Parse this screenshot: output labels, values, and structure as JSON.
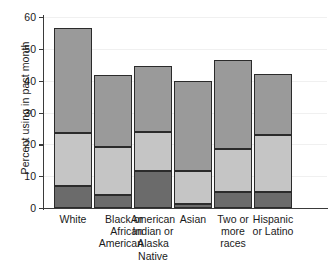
{
  "chart_data": {
    "type": "bar",
    "subtype": "stacked-bar",
    "title": "",
    "xlabel": "",
    "ylabel": "Percent using in past month",
    "ylim": [
      0,
      60
    ],
    "yticks": [
      0,
      10,
      20,
      30,
      40,
      50,
      60
    ],
    "ytick_labels": [
      "0",
      "10",
      "20",
      "30",
      "40",
      "50",
      "60"
    ],
    "grid": true,
    "grid_axis": "y",
    "legend": "none",
    "categories": [
      "White",
      "Black or\nAfrican\nAmerican",
      "American\nIndian or\nAlaska\nNative",
      "Asian",
      "Two or\nmore\nraces",
      "Hispanic\nor Latino"
    ],
    "category_align": [
      "center",
      "right",
      "center",
      "center",
      "center",
      "center"
    ],
    "series": [
      {
        "name": "bottom-segment",
        "color": "#6b6b6b",
        "values": [
          7.0,
          4.1,
          11.7,
          1.3,
          5.0,
          4.9
        ]
      },
      {
        "name": "middle-segment",
        "color": "#c5c5c5",
        "values": [
          16.6,
          15.1,
          12.3,
          10.2,
          13.6,
          17.9
        ]
      },
      {
        "name": "top-segment",
        "color": "#9a9a9a",
        "values": [
          33.1,
          22.6,
          20.6,
          28.3,
          27.8,
          19.4
        ]
      }
    ],
    "cumulative_tops": [
      [
        7.0,
        23.6,
        56.7
      ],
      [
        4.1,
        19.2,
        41.8
      ],
      [
        11.7,
        24.0,
        44.6
      ],
      [
        1.3,
        11.5,
        39.8
      ],
      [
        5.0,
        18.6,
        46.4
      ],
      [
        4.9,
        22.8,
        42.2
      ]
    ],
    "totals": [
      56.7,
      41.8,
      44.6,
      39.8,
      46.4,
      42.2
    ],
    "bar_border_color": "#2b2b2b",
    "axis_color": "#3a3a3a",
    "gridline_color": "#f0f0f0",
    "background": "#ffffff"
  }
}
